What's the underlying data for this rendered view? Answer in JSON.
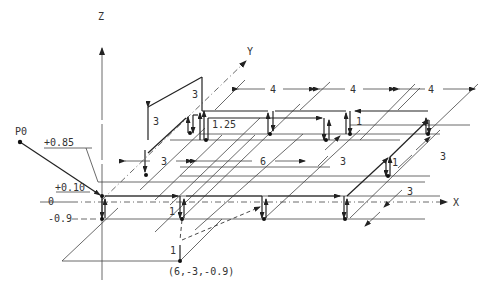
{
  "diagram": {
    "type": "isometric CNC tool path",
    "axes": {
      "x": "X",
      "y": "Y",
      "z": "Z"
    },
    "start_point": "P0",
    "z_levels": [
      "+0.85",
      "+0.10",
      "0",
      "-0.9"
    ],
    "dimensions": {
      "x_spacing_top": [
        "4",
        "4",
        "4"
      ],
      "x_spacing_mid": [
        "3",
        "6"
      ],
      "y_spacing_right": [
        "3",
        "3"
      ],
      "y_spacing_mid": "3",
      "z_heights": [
        "3",
        "3",
        "1.25",
        "1",
        "1",
        "1",
        "1"
      ]
    },
    "coordinate_label": "(6,-3,-0.9)"
  },
  "labels": {
    "z_axis": "Z",
    "y_axis": "Y",
    "x_axis": "X",
    "p0": "P0",
    "z_085": "+0.85",
    "z_010": "+0.10",
    "z_0": "0",
    "z_m09": "-0.9",
    "dim_4a": "4",
    "dim_4b": "4",
    "dim_4c": "4",
    "dim_3_left": "3",
    "dim_6": "6",
    "dim_3_mid": "3",
    "dim_3_right_upper": "3",
    "dim_3_right_lower": "3",
    "dim_3_vert_a": "3",
    "dim_3_vert_b": "3",
    "dim_125": "1.25",
    "dim_1_a": "1",
    "dim_1_b": "1",
    "dim_1_c": "1",
    "dim_1_d": "1",
    "coord": "(6,-3,-0.9)"
  }
}
